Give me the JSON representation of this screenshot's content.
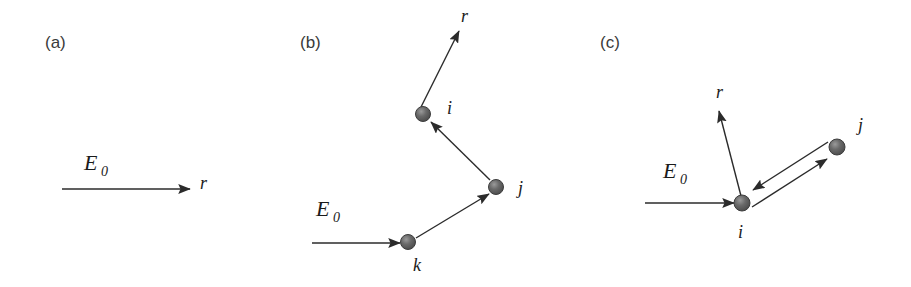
{
  "figure": {
    "background_color": "#ffffff",
    "line_color": "#2b2b2b",
    "sphere_color": "#5a5a5a",
    "sphere_outline_color": "#3d3d3d",
    "label_color": "#1a1a1a",
    "panel_label_color": "#3a3a3a"
  },
  "panels": [
    {
      "id": "a",
      "label": "(a)",
      "incident_field_label": "E",
      "incident_field_sub": "0",
      "scattered_direction_label": "r",
      "particles": []
    },
    {
      "id": "b",
      "label": "(b)",
      "incident_field_label": "E",
      "incident_field_sub": "0",
      "scattered_direction_label": "r",
      "particles": [
        {
          "name": "k"
        },
        {
          "name": "j"
        },
        {
          "name": "i"
        }
      ]
    },
    {
      "id": "c",
      "label": "(c)",
      "incident_field_label": "E",
      "incident_field_sub": "0",
      "scattered_direction_label": "r",
      "particles": [
        {
          "name": "i"
        },
        {
          "name": "j"
        }
      ]
    }
  ]
}
